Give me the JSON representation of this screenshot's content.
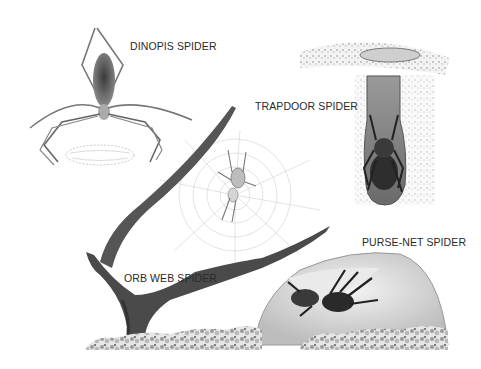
{
  "figure": {
    "background": "#ffffff",
    "ink_color": "#2a2a2a"
  },
  "labels": {
    "dinopis": "DINOPIS SPIDER",
    "trapdoor": "TRAPDOOR SPIDER",
    "orb_web": "ORB WEB SPIDER",
    "purse_net": "PURSE-NET SPIDER"
  }
}
